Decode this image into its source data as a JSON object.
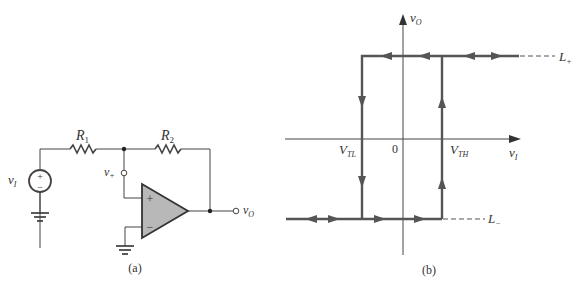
{
  "figure_a": {
    "caption": "(a)",
    "labels": {
      "r1": "R",
      "r1_sub": "1",
      "r2": "R",
      "r2_sub": "2",
      "vi": "v",
      "vi_sub": "I",
      "vplus": "v",
      "vplus_sub": "+",
      "vo": "v",
      "vo_sub": "O",
      "src_plus": "+",
      "src_minus": "−",
      "opamp_plus": "+",
      "opamp_minus": "−"
    },
    "colors": {
      "wire": "#444444",
      "opamp_fill": "#b8b8b8"
    }
  },
  "figure_b": {
    "caption": "(b)",
    "labels": {
      "y_axis": "v",
      "y_axis_sub": "O",
      "x_axis": "v",
      "x_axis_sub": "I",
      "vtl": "V",
      "vtl_sub": "TL",
      "origin": "0",
      "vth": "V",
      "vth_sub": "TH",
      "lplus": "L",
      "lplus_sub": "+",
      "lminus": "L",
      "lminus_sub": "−"
    },
    "colors": {
      "trace": "#555555",
      "axis": "#444444"
    }
  }
}
